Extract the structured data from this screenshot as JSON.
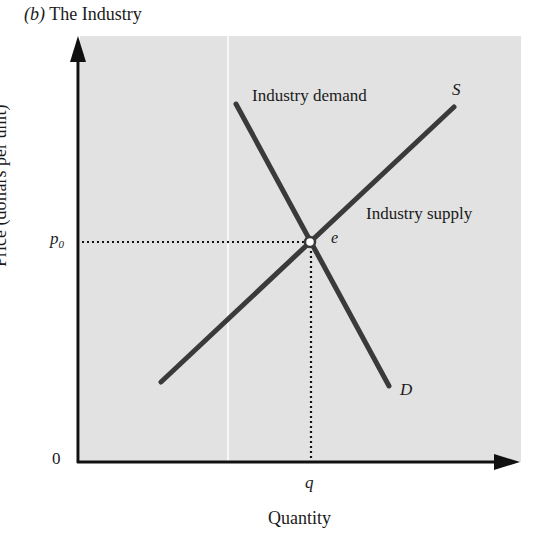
{
  "title": {
    "panel": "(b)",
    "text": "The Industry"
  },
  "axes": {
    "y_label": "Price (dollars per unit)",
    "x_label": "Quantity",
    "origin": "0",
    "y_tick": "p",
    "y_tick_sub": "0",
    "x_tick": "q"
  },
  "curves": {
    "supply": {
      "short_label": "S",
      "long_label": "Industry supply",
      "color": "#3a3a3a"
    },
    "demand": {
      "short_label": "D",
      "long_label": "Industry demand",
      "color": "#3a3a3a"
    }
  },
  "equilibrium": {
    "label": "e"
  },
  "colors": {
    "plot_background": "#e2e2e2",
    "axis": "#111111",
    "curve": "#3a3a3a"
  }
}
